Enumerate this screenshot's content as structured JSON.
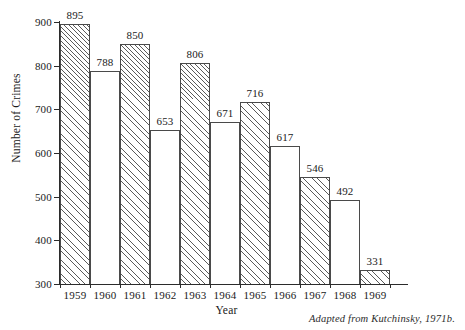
{
  "chart_data": {
    "type": "bar",
    "title": "",
    "subtitle": "",
    "xlabel": "Year",
    "ylabel": "Number of Crimes",
    "categories": [
      "1959",
      "1960",
      "1961",
      "1962",
      "1963",
      "1964",
      "1965",
      "1966",
      "1967",
      "1968",
      "1969"
    ],
    "values": [
      895,
      788,
      850,
      653,
      806,
      671,
      716,
      617,
      546,
      492,
      331
    ],
    "ylim": [
      300,
      900
    ],
    "yticks": [
      300,
      400,
      500,
      600,
      700,
      800,
      900
    ],
    "ytick_labels": [
      "300",
      "400",
      "500",
      "600",
      "700",
      "800",
      "900"
    ],
    "data_labels": [
      "895",
      "788",
      "850",
      "653",
      "806",
      "671",
      "716",
      "617",
      "546",
      "492",
      "331"
    ],
    "bar_styles": [
      "hatched",
      "plain",
      "hatched",
      "plain",
      "hatched",
      "plain",
      "hatched",
      "plain",
      "hatched",
      "plain",
      "hatched"
    ],
    "grid": false,
    "legend": null,
    "bar_gap": 0,
    "colors": {
      "axis": "#2b2b2b",
      "bar_outline": "#4a4a4a",
      "bar_hatch": "#5a5a5a",
      "bar_fill_plain": "#ffffff",
      "background": "#ffffff",
      "text": "#1a1a1a"
    },
    "annotations": [
      {
        "name": "source-note",
        "text": "Adapted from Kutchinsky, 1971b."
      }
    ]
  },
  "caption": {
    "source_note": "Adapted from Kutchinsky, 1971b."
  }
}
